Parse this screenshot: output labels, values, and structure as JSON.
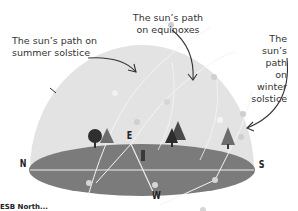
{
  "labels": {
    "summer": [
      "The sun’s path on",
      "summer solstice"
    ],
    "equinox": [
      "The sun’s path",
      "on equinoxes"
    ],
    "winter": [
      "The sun’s path on",
      "winter solstice"
    ]
  },
  "directions": {
    "north": "N",
    "south": "S",
    "east": "E",
    "west": "W"
  },
  "caption": "ESB North...",
  "colors": {
    "dome": "#e2e2e2",
    "ground": "#7a7a7a",
    "path_line": "#f4f4f4",
    "sun_dot": "#d4d4d4",
    "arrow": "#333333",
    "tree_dark": "#2e2e2e",
    "tree_mid": "#6c6c6c"
  }
}
